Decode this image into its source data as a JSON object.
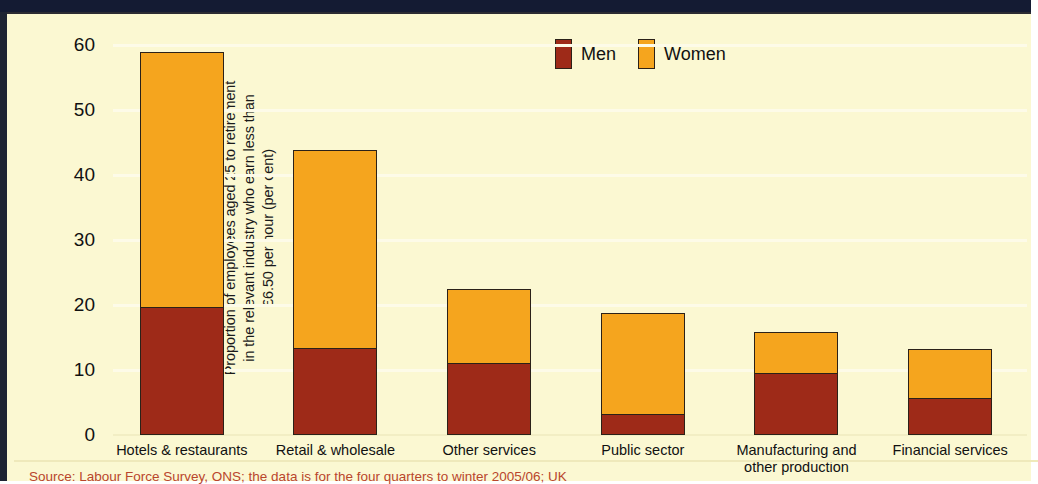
{
  "chart_data": {
    "type": "bar",
    "subtype": "stacked-vertical",
    "title": "",
    "xlabel": "",
    "ylabel": "Proportion of employees aged 25 to retirement in the relevant industry who earn less than £6.50 per hour (per cent)",
    "ylabel_lines": [
      "Proportion of employees aged 25 to retirement",
      "in the relevant industry who earn less than",
      "£6.50 per hour (per cent)"
    ],
    "ylim": [
      0,
      60
    ],
    "yticks": [
      0,
      10,
      20,
      30,
      40,
      50,
      60
    ],
    "ytick_labels": [
      "0",
      "10",
      "20",
      "30",
      "40",
      "50",
      "60"
    ],
    "grid": true,
    "grid_axis": "y",
    "legend_position": "top-right",
    "categories": [
      "Hotels & restaurants",
      "Retail & wholesale",
      "Other services",
      "Public sector",
      "Manufacturing and other production",
      "Financial services"
    ],
    "category_label_lines": [
      [
        "Hotels & restaurants"
      ],
      [
        "Retail & wholesale"
      ],
      [
        "Other services"
      ],
      [
        "Public sector"
      ],
      [
        "Manufacturing and",
        "other production"
      ],
      [
        "Financial services"
      ]
    ],
    "series": [
      {
        "name": "Men",
        "color": "#9e2a18",
        "values": [
          19.8,
          13.6,
          11.3,
          3.4,
          9.7,
          5.9
        ]
      },
      {
        "name": "Women",
        "color": "#f5a51e",
        "values": [
          39.2,
          30.3,
          11.2,
          15.3,
          6.1,
          7.3
        ]
      }
    ],
    "totals": [
      59.0,
      43.9,
      22.5,
      18.7,
      15.8,
      13.2
    ]
  },
  "legend": {
    "entries": [
      {
        "label": "Men",
        "color": "#9e2a18"
      },
      {
        "label": "Women",
        "color": "#f5a51e"
      }
    ]
  },
  "source": {
    "text": "Source: Labour Force Survey, ONS; the data is for the four quarters to winter 2005/06; UK",
    "color": "#b9462c"
  },
  "colors": {
    "background": "#fbf8d2",
    "men": "#9e2a18",
    "women": "#f5a51e",
    "bar_outline": "#2b2118",
    "gridline": "#fdfbe8",
    "top_band": "#141b33",
    "text": "#111111"
  }
}
